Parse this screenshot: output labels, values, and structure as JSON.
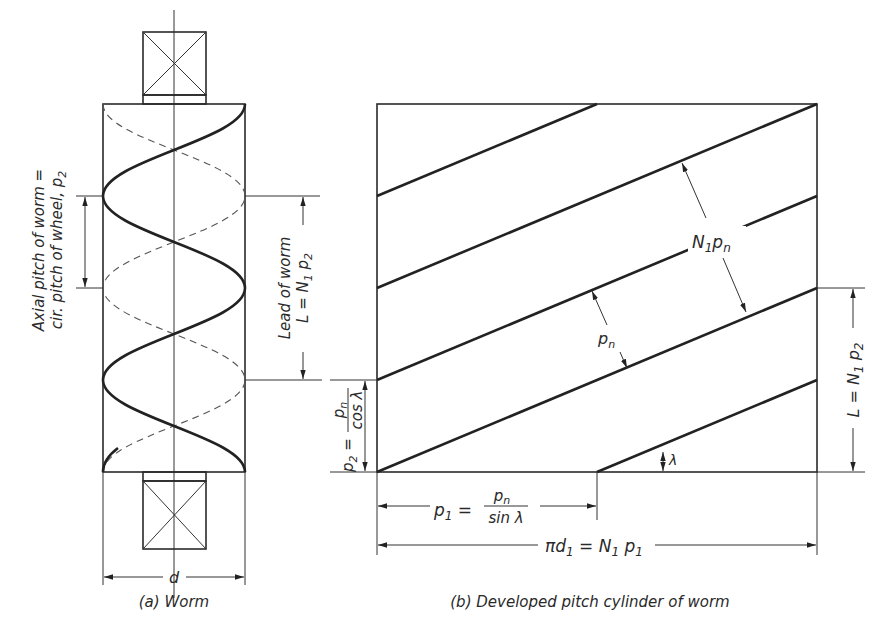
{
  "figure": {
    "panel_a": {
      "caption": "(a) Worm",
      "diameter_label": "d",
      "axial_pitch_label_line1": "Axial pitch of worm =",
      "axial_pitch_label_line2": "cir. pitch of wheel, p",
      "axial_pitch_sub": "2",
      "lead_label_line1": "Lead of worm",
      "lead_label_line2": "L = N",
      "lead_label_sub1": "1",
      "lead_label_p": " p",
      "lead_label_sub2": "2"
    },
    "panel_b": {
      "caption": "(b) Developed pitch cylinder of worm",
      "normal_pitch_label": "p",
      "normal_pitch_sub": "n",
      "n1pn_label_N": "N",
      "n1pn_label_sub1": "1",
      "n1pn_label_p": "p",
      "n1pn_label_subn": "n",
      "lead_angle_label": "λ",
      "p2_label": "p",
      "p2_sub": "2",
      "p2_eq": " =",
      "p2_num": "p",
      "p2_num_sub": "n",
      "p2_den": "cos λ",
      "p1_label": "p",
      "p1_sub": "1",
      "p1_eq": " =",
      "p1_num": "p",
      "p1_num_sub": "n",
      "p1_den": "sin λ",
      "circumference_label": "πd",
      "circumference_sub": "1",
      "circumference_eq": " = N",
      "circumference_sub2": "1",
      "circumference_p": " p",
      "circumference_sub3": "1",
      "lead_right_label": "L = N",
      "lead_right_sub1": "1",
      "lead_right_p": " p",
      "lead_right_sub2": "2"
    }
  }
}
